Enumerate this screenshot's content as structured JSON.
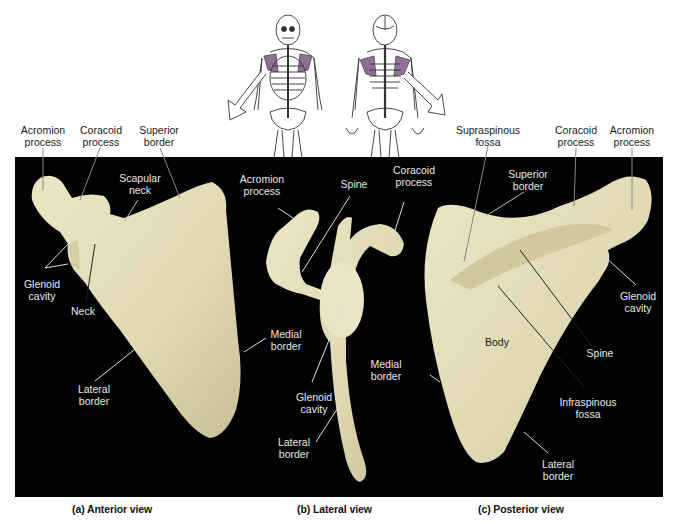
{
  "figure": {
    "colors": {
      "panel_background": "#020202",
      "bone": "#e3dcb7",
      "bone_shadow": "#bfb58a",
      "highlight_purple": "#8f6f95",
      "leader_light": "#d8d8d8",
      "leader_dark": "#222222"
    },
    "orientation_sketch": {
      "anterior_figure": "skeleton-front-icon",
      "posterior_figure": "skeleton-back-icon",
      "highlighted_region": "scapula"
    },
    "views": [
      {
        "id": "anterior",
        "caption": "(a) Anterior view",
        "labels": {
          "acromion_process": "Acromion\nprocess",
          "coracoid_process": "Coracoid\nprocess",
          "superior_border": "Superior\nborder",
          "scapular_neck": "Scapular\nneck",
          "glenoid_cavity": "Glenoid\ncavity",
          "neck": "Neck",
          "lateral_border": "Lateral\nborder",
          "medial_border": "Medial\nborder"
        }
      },
      {
        "id": "lateral",
        "caption": "(b) Lateral view",
        "labels": {
          "acromion_process": "Acromion\nprocess",
          "spine": "Spine",
          "coracoid_process": "Coracoid\nprocess",
          "glenoid_cavity": "Glenoid\ncavity",
          "lateral_border": "Lateral\nborder"
        }
      },
      {
        "id": "posterior",
        "caption": "(c) Posterior view",
        "labels": {
          "supraspinous_fossa": "Supraspinous\nfossa",
          "coracoid_process": "Coracoid\nprocess",
          "acromion_process": "Acromion\nprocess",
          "superior_border": "Superior\nborder",
          "glenoid_cavity": "Glenoid\ncavity",
          "body": "Body",
          "spine": "Spine",
          "medial_border": "Medial\nborder",
          "infraspinous_fossa": "Infraspinous\nfossa",
          "lateral_border": "Lateral\nborder"
        }
      }
    ]
  }
}
